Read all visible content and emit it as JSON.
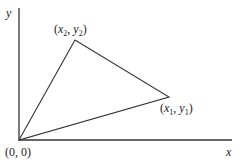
{
  "diagram": {
    "axes": {
      "x_label": "x",
      "y_label": "y",
      "origin_label": "(0, 0)",
      "color": "#333333"
    },
    "vertices": [
      {
        "id": "origin",
        "label": "(0, 0)",
        "px": [
          19,
          140
        ]
      },
      {
        "id": "p1",
        "var_x": "x",
        "sub_x": "1",
        "var_y": "y",
        "sub_y": "1",
        "px": [
          169,
          97
        ]
      },
      {
        "id": "p2",
        "var_x": "x",
        "sub_x": "2",
        "var_y": "y",
        "sub_y": "2",
        "px": [
          75,
          40
        ]
      }
    ],
    "triangle_color": "#333333",
    "punct": {
      "open": "(",
      "comma": ", ",
      "close": ")"
    }
  }
}
